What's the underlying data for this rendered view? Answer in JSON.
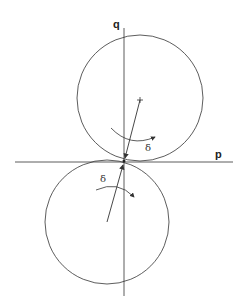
{
  "diagram": {
    "labels": {
      "q_axis": "q",
      "p_axis": "p",
      "upper_angle": "δ",
      "lower_angle": "δ"
    },
    "colors": {
      "stroke": "#333333",
      "background": "#ffffff"
    },
    "elements": {
      "upper_circle": {
        "cx": 140,
        "cy": 98,
        "r": 63
      },
      "lower_circle": {
        "cx": 107,
        "cy": 222,
        "r": 62
      },
      "contact_point": {
        "x": 124,
        "y": 161
      }
    }
  }
}
